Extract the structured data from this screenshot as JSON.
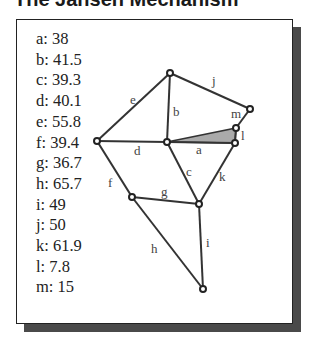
{
  "title": "The Jansen Mechanism",
  "legend": [
    {
      "key": "a",
      "value": "38",
      "text": "a: 38"
    },
    {
      "key": "b",
      "value": "41.5",
      "text": "b: 41.5"
    },
    {
      "key": "c",
      "value": "39.3",
      "text": "c: 39.3"
    },
    {
      "key": "d",
      "value": "40.1",
      "text": "d: 40.1"
    },
    {
      "key": "e",
      "value": "55.8",
      "text": "e: 55.8"
    },
    {
      "key": "f",
      "value": "39.4",
      "text": "f: 39.4"
    },
    {
      "key": "g",
      "value": "36.7",
      "text": "g: 36.7"
    },
    {
      "key": "h",
      "value": "65.7",
      "text": "h: 65.7"
    },
    {
      "key": "i",
      "value": "49",
      "text": "i: 49"
    },
    {
      "key": "j",
      "value": "50",
      "text": "j: 50"
    },
    {
      "key": "k",
      "value": "61.9",
      "text": "k: 61.9"
    },
    {
      "key": "l",
      "value": "7.8",
      "text": "l: 7.8"
    },
    {
      "key": "m",
      "value": "15",
      "text": "m: 15"
    }
  ],
  "edge_labels": {
    "a": "a",
    "b": "b",
    "c": "c",
    "d": "d",
    "e": "e",
    "f": "f",
    "g": "g",
    "h": "h",
    "i": "i",
    "j": "j",
    "k": "k",
    "l": "l",
    "m": "m"
  },
  "colors": {
    "edge": "#333333",
    "crank_fill": "#aaaaaa",
    "shadow": "#4a4a4a"
  }
}
